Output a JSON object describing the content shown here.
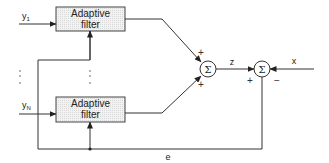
{
  "diagram": {
    "type": "adaptive-filter-combiner",
    "inputs": [
      {
        "label": "y",
        "subscript": "1"
      },
      {
        "label": "y",
        "subscript": "N"
      }
    ],
    "blocks": [
      {
        "line1": "Adaptive",
        "line2": "filter"
      },
      {
        "line1": "Adaptive",
        "line2": "filter"
      }
    ],
    "ellipsis": ":",
    "summer1": {
      "symbol": "Σ",
      "sign_top": "+",
      "sign_bottom": "+"
    },
    "summer2": {
      "symbol": "Σ",
      "sign_left": "+",
      "sign_right": "−"
    },
    "signals": {
      "z": "z",
      "x": "x",
      "e": "e"
    },
    "colors": {
      "line": "#333333",
      "box_fill": "#ececec",
      "box_border": "#444444"
    }
  }
}
